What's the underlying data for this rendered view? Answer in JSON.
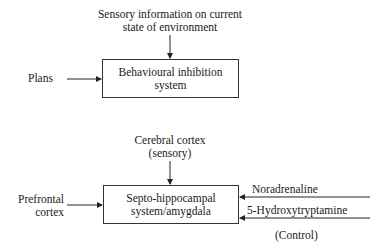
{
  "diagram1": {
    "top_input": [
      "Sensory information on current",
      "state of environment"
    ],
    "left_input": "Plans",
    "box": [
      "Behavioural inhibition",
      "system"
    ]
  },
  "diagram2": {
    "top_input": [
      "Cerebral cortex",
      "(sensory)"
    ],
    "left_input": [
      "Prefrontal",
      "cortex"
    ],
    "box": [
      "Septo-hippocampal",
      "system/amygdala"
    ],
    "right_inputs": [
      "Noradrenaline",
      "5-Hydroxytryptamine"
    ],
    "right_caption": "(Control)"
  }
}
